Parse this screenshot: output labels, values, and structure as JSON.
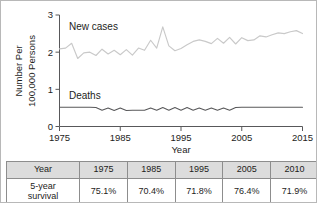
{
  "chart_data": {
    "type": "line",
    "title": "",
    "xlabel": "Year",
    "ylabel": "Number Per 100,000 Persons",
    "ylabel_line1": "Number Per",
    "ylabel_line2": "100,000 Persons",
    "xlim": [
      1975,
      2015
    ],
    "ylim": [
      0,
      3
    ],
    "yticks": [
      "0",
      "1",
      "2",
      "3"
    ],
    "ytick_values": [
      0,
      1,
      2,
      3
    ],
    "xticks": [
      "1975",
      "1985",
      "1995",
      "2005",
      "2015"
    ],
    "xtick_values": [
      1975,
      1985,
      1995,
      2005,
      2015
    ],
    "grid": false,
    "legend_position": "inline-labels",
    "series": [
      {
        "name": "New cases",
        "color": "#c9c9c9",
        "x": [
          1975,
          1976,
          1977,
          1978,
          1979,
          1980,
          1981,
          1982,
          1983,
          1984,
          1985,
          1986,
          1987,
          1988,
          1989,
          1990,
          1991,
          1992,
          1993,
          1994,
          1995,
          1996,
          1997,
          1998,
          1999,
          2000,
          2001,
          2002,
          2003,
          2004,
          2005,
          2006,
          2007,
          2008,
          2009,
          2010,
          2011,
          2012,
          2013,
          2014,
          2015
        ],
        "values": [
          2.09,
          2.11,
          2.24,
          1.83,
          1.98,
          2.0,
          1.91,
          2.08,
          1.95,
          2.05,
          1.93,
          2.07,
          1.92,
          2.11,
          2.05,
          2.32,
          2.11,
          2.68,
          2.17,
          2.04,
          2.1,
          2.2,
          2.29,
          2.33,
          2.29,
          2.23,
          2.37,
          2.24,
          2.4,
          2.22,
          2.39,
          2.31,
          2.33,
          2.44,
          2.41,
          2.47,
          2.52,
          2.5,
          2.55,
          2.58,
          2.5
        ]
      },
      {
        "name": "Deaths",
        "color": "#58585a",
        "x": [
          1975,
          1976,
          1977,
          1978,
          1979,
          1980,
          1981,
          1982,
          1983,
          1984,
          1985,
          1986,
          1987,
          1988,
          1989,
          1990,
          1991,
          1992,
          1993,
          1994,
          1995,
          1996,
          1997,
          1998,
          1999,
          2000,
          2001,
          2002,
          2003,
          2004,
          2005,
          2006,
          2007,
          2008,
          2009,
          2010,
          2011,
          2012,
          2013,
          2014,
          2015
        ],
        "values": [
          0.52,
          0.52,
          0.52,
          0.52,
          0.52,
          0.52,
          0.51,
          0.44,
          0.5,
          0.43,
          0.5,
          0.43,
          0.44,
          0.44,
          0.44,
          0.5,
          0.44,
          0.51,
          0.44,
          0.51,
          0.44,
          0.51,
          0.44,
          0.5,
          0.44,
          0.5,
          0.44,
          0.5,
          0.44,
          0.51,
          0.52,
          0.52,
          0.52,
          0.52,
          0.52,
          0.52,
          0.52,
          0.52,
          0.52,
          0.52,
          0.52
        ]
      }
    ]
  },
  "table": {
    "header": [
      "Year",
      "1975",
      "1985",
      "1995",
      "2005",
      "2010"
    ],
    "row_label": "5-year\nsurvival",
    "row_label_line1": "5-year",
    "row_label_line2": "survival",
    "values": [
      "75.1%",
      "70.4%",
      "71.8%",
      "76.4%",
      "71.9%"
    ]
  },
  "colors": {
    "new_cases_line": "#c9c9c9",
    "deaths_line": "#58585a",
    "axis": "#58585a",
    "table_header_bg": "#dcdcdc",
    "table_border": "#8d8d8d",
    "frame_border": "#b8b8b8",
    "text": "#1d1d1b"
  }
}
